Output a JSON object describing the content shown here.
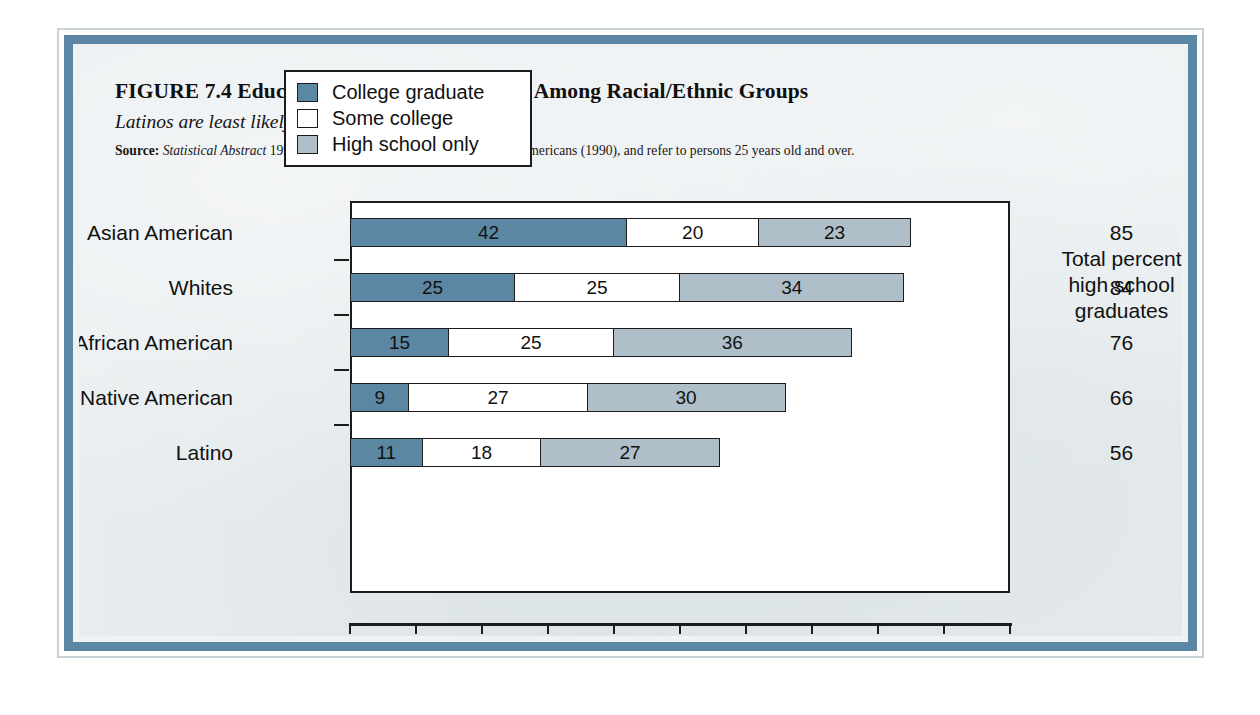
{
  "figure": {
    "title": "FIGURE 7.4  Educational Attainment Differs Among Racial/Ethnic Groups",
    "subtitle": "Latinos are least likely to finish high school.",
    "source_label": "Source:",
    "source_italic": "Statistical Abstract",
    "source_rest": " 1999; Figures are for 1998, except for Native Americans (1990), and refer to persons 25 years old and over."
  },
  "totals_column": {
    "header_line1": "Total percent",
    "header_line2": "high school",
    "header_line3": "graduates",
    "values": [
      "85",
      "84",
      "76",
      "66",
      "56"
    ]
  },
  "colors": {
    "college_graduate": "#5c87a3",
    "some_college": "#ffffff",
    "high_school_only": "#aebfc9",
    "frame": "#5b86a4",
    "page_background": "#e9eef0",
    "axis": "#1c1c1c"
  },
  "chart_data": {
    "type": "bar",
    "orientation": "horizontal",
    "stacked": true,
    "title": "FIGURE 7.4  Educational Attainment Differs Among Racial/Ethnic Groups",
    "subtitle": "Latinos are least likely to finish high school.",
    "xlabel": "Percent of population ages 25–44",
    "ylabel": "",
    "xlim": [
      0,
      100
    ],
    "xticks": [
      "0",
      "10",
      "20",
      "30",
      "40",
      "50",
      "60",
      "70",
      "80",
      "90",
      "100"
    ],
    "grid": false,
    "legend_position": "top-center-inside",
    "categories": [
      "Asian American",
      "Whites",
      "African American",
      "Native American",
      "Latino"
    ],
    "series": [
      {
        "name": "College graduate",
        "values": [
          42,
          25,
          15,
          9,
          11
        ]
      },
      {
        "name": "Some college",
        "values": [
          20,
          25,
          25,
          27,
          18
        ]
      },
      {
        "name": "High school only",
        "values": [
          23,
          34,
          36,
          30,
          27
        ]
      }
    ],
    "totals_label": "Total percent high school graduates",
    "totals": [
      85,
      84,
      76,
      66,
      56
    ]
  }
}
